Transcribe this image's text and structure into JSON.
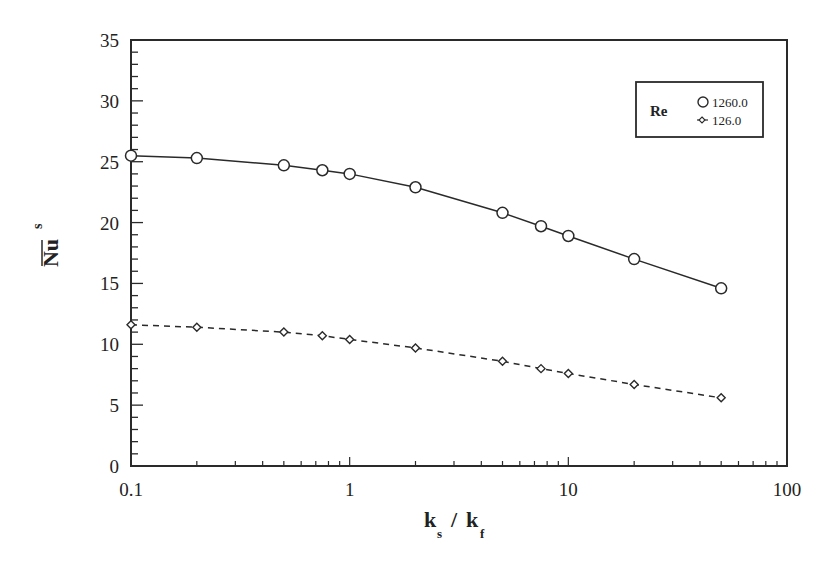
{
  "chart_data": {
    "type": "line",
    "title": "",
    "xlabel": "k_s / k_f",
    "ylabel": "Nu_s (mean)",
    "xscale": "log",
    "xlim": [
      0.1,
      100
    ],
    "ylim": [
      0,
      35
    ],
    "x_ticks": [
      "0.1",
      "1",
      "10",
      "100"
    ],
    "y_ticks": [
      "0",
      "5",
      "10",
      "15",
      "20",
      "25",
      "30",
      "35"
    ],
    "grid": false,
    "legend_position": "upper right",
    "legend_title": "Re",
    "x": [
      0.1,
      0.2,
      0.5,
      0.75,
      1,
      2,
      5,
      7.5,
      10,
      20,
      50
    ],
    "series": [
      {
        "name": "1260.0",
        "marker": "circle",
        "line": "solid",
        "values": [
          25.5,
          25.3,
          24.7,
          24.3,
          24.0,
          22.9,
          20.8,
          19.7,
          18.9,
          17.0,
          14.6
        ]
      },
      {
        "name": "126.0",
        "marker": "diamond",
        "line": "dashed",
        "values": [
          11.6,
          11.4,
          11.0,
          10.7,
          10.4,
          9.7,
          8.6,
          8.0,
          7.6,
          6.7,
          5.6
        ]
      }
    ]
  },
  "axes": {
    "x_title_main": "k",
    "x_title_sub1": "s",
    "x_title_slash": "/",
    "x_title_main2": "k",
    "x_title_sub2": "f",
    "y_title_main": "Nu",
    "y_title_sub": "s"
  },
  "legend": {
    "title": "Re",
    "items": [
      "1260.0",
      "126.0"
    ]
  },
  "colors": {
    "ink": "#2a2a2a",
    "background": "#ffffff"
  }
}
